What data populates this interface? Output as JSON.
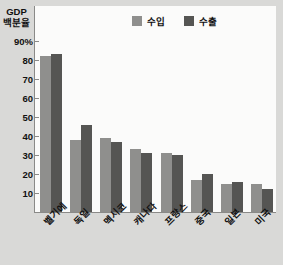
{
  "chart_data": {
    "type": "bar",
    "title": "",
    "ylabel": "GDP 백분율",
    "xlabel": "",
    "ylim": [
      0,
      90
    ],
    "grid": false,
    "legend_position": "top-right",
    "categories": [
      "벨기에",
      "독일",
      "멕시코",
      "캐나다",
      "프랑스",
      "중국",
      "일본",
      "미국"
    ],
    "ytick_labels": [
      "90%",
      "80",
      "70",
      "60",
      "50",
      "40",
      "30",
      "20",
      "10"
    ],
    "ytick_values": [
      90,
      80,
      70,
      60,
      50,
      40,
      30,
      20,
      10
    ],
    "series": [
      {
        "name": "수입",
        "color": "#8f8f8d",
        "values": [
          82,
          38,
          39,
          33,
          31,
          17,
          15,
          15
        ]
      },
      {
        "name": "수출",
        "color": "#555553",
        "values": [
          83,
          46,
          37,
          31,
          30,
          20,
          16,
          12
        ]
      }
    ]
  },
  "axis": {
    "title_line1": "GDP",
    "title_line2": "백분율"
  },
  "colors": {
    "background": "#d9d9d7",
    "plot_background": "#fbfbfa",
    "axis": "#8a8a88",
    "import": "#8f8f8d",
    "export": "#555553"
  }
}
